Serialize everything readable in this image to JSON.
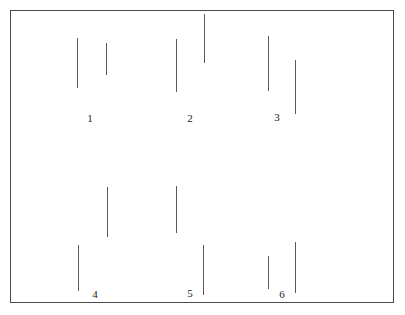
{
  "figure": {
    "canvas": {
      "width": 405,
      "height": 315,
      "background": "#ffffff"
    },
    "frame": {
      "name": "figure-border",
      "x": 10,
      "y": 10,
      "width": 384,
      "height": 293,
      "stroke_color": "#4a4a4a",
      "stroke_width": 1
    },
    "line_style": {
      "stroke_color": "#5a5a5a",
      "stroke_width": 1
    },
    "label_style": {
      "color": "#1c1c1c",
      "font_size_px": 11
    }
  },
  "chart_data": {
    "type": "scatter",
    "xlabel": "",
    "ylabel": "",
    "xlim": [
      10,
      394
    ],
    "ylim": [
      10,
      303
    ],
    "grid": false,
    "legend": "none",
    "categories": [
      "1",
      "2",
      "3",
      "4",
      "5",
      "6"
    ],
    "pairs": [
      {
        "label": "1",
        "label_x": 90,
        "label_y": 118,
        "left": {
          "x": 77,
          "y_top": 38,
          "y_bottom": 88,
          "length": 50
        },
        "right": {
          "x": 106,
          "y_top": 43,
          "y_bottom": 75,
          "length": 32
        }
      },
      {
        "label": "2",
        "label_x": 190,
        "label_y": 118,
        "left": {
          "x": 176,
          "y_top": 39,
          "y_bottom": 92,
          "length": 53
        },
        "right": {
          "x": 204,
          "y_top": 14,
          "y_bottom": 63,
          "length": 49
        }
      },
      {
        "label": "3",
        "label_x": 277,
        "label_y": 117,
        "left": {
          "x": 268,
          "y_top": 36,
          "y_bottom": 91,
          "length": 55
        },
        "right": {
          "x": 295,
          "y_top": 60,
          "y_bottom": 114,
          "length": 54
        }
      },
      {
        "label": "4",
        "label_x": 95,
        "label_y": 294,
        "left": {
          "x": 78,
          "y_top": 245,
          "y_bottom": 291,
          "length": 46
        },
        "right": {
          "x": 107,
          "y_top": 187,
          "y_bottom": 237,
          "length": 50
        }
      },
      {
        "label": "5",
        "label_x": 190,
        "label_y": 293,
        "left": {
          "x": 176,
          "y_top": 186,
          "y_bottom": 233,
          "length": 47
        },
        "right": {
          "x": 203,
          "y_top": 245,
          "y_bottom": 295,
          "length": 50
        }
      },
      {
        "label": "6",
        "label_x": 282,
        "label_y": 294,
        "left": {
          "x": 268,
          "y_top": 256,
          "y_bottom": 289,
          "length": 33
        },
        "right": {
          "x": 295,
          "y_top": 242,
          "y_bottom": 293,
          "length": 51
        }
      }
    ]
  }
}
